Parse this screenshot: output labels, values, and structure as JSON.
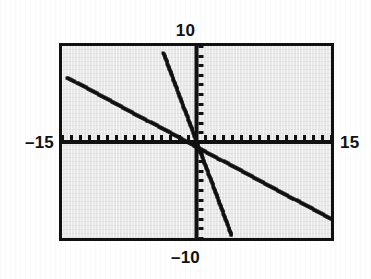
{
  "window_labels": {
    "ymax": "10",
    "ymin": "–10",
    "xmin": "–15",
    "xmax": "15"
  },
  "colors": {
    "screen_background": "#e7e7e7",
    "frame": "#111111",
    "axis": "#111111",
    "curve": "#111111",
    "page_background": "#ffffff"
  },
  "chart_data": {
    "type": "line",
    "title": "",
    "xlabel": "",
    "ylabel": "",
    "xlim": [
      -15,
      15
    ],
    "ylim": [
      -10,
      10
    ],
    "xtick_step": 1,
    "ytick_step": 1,
    "grid": false,
    "legend": null,
    "axis_style": "tick-marked crosshair axes drawn through origin",
    "tick_labels_shown": false,
    "corner_labels": {
      "top": "10",
      "bottom": "-10",
      "left": "-15",
      "right": "15"
    },
    "series": [
      {
        "name": "shallow descending line",
        "equation": "y = -0.5x - 0.5",
        "slope": -0.5,
        "intercept": -0.5,
        "x": [
          -14.4,
          15.0
        ],
        "y": [
          6.7,
          -8.0
        ],
        "style": "dotted-pixel line"
      },
      {
        "name": "steep descending line",
        "equation": "y = -2.5x",
        "slope": -2.5,
        "intercept": 0,
        "x": [
          -3.7,
          3.9
        ],
        "y": [
          9.3,
          -9.7
        ],
        "style": "dotted-pixel line"
      }
    ]
  }
}
